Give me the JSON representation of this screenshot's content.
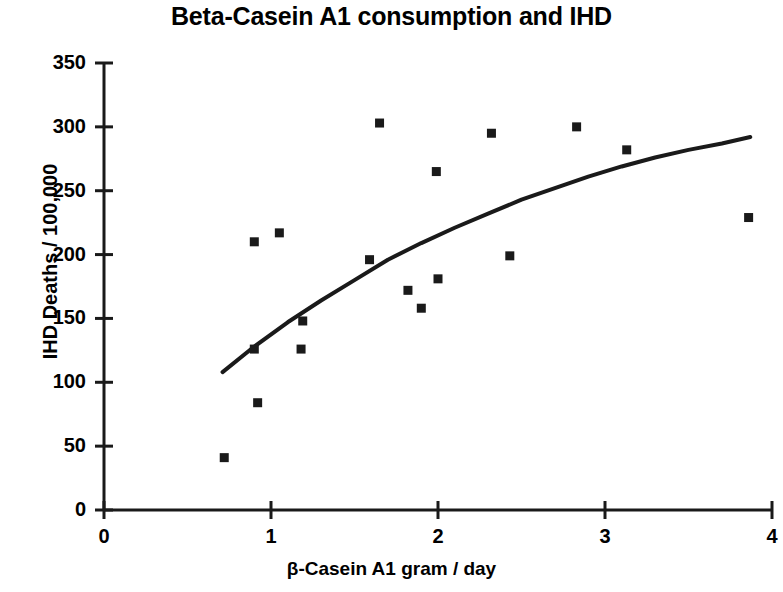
{
  "chart_data": {
    "type": "scatter",
    "title": "Beta-Casein A1 consumption and IHD",
    "xlabel": "β-Casein A1 gram / day",
    "ylabel": "IHD Deaths / 100,000",
    "xlim": [
      0,
      4
    ],
    "ylim": [
      0,
      350
    ],
    "xticks": [
      "0",
      "1",
      "2",
      "3",
      "4"
    ],
    "xtick_values": [
      0,
      1,
      2,
      3,
      4
    ],
    "yticks": [
      "0",
      "50",
      "100",
      "150",
      "200",
      "250",
      "300",
      "350"
    ],
    "ytick_values": [
      0,
      50,
      100,
      150,
      200,
      250,
      300,
      350
    ],
    "grid": false,
    "legend": false,
    "marker": "square",
    "marker_color": "#1a1a1a",
    "line_color": "#1a1a1a",
    "series": [
      {
        "name": "Countries",
        "type": "scatter",
        "points": [
          {
            "x": 0.72,
            "y": 41
          },
          {
            "x": 0.9,
            "y": 210
          },
          {
            "x": 0.9,
            "y": 126
          },
          {
            "x": 0.92,
            "y": 84
          },
          {
            "x": 1.05,
            "y": 217
          },
          {
            "x": 1.18,
            "y": 126
          },
          {
            "x": 1.19,
            "y": 148
          },
          {
            "x": 1.59,
            "y": 196
          },
          {
            "x": 1.65,
            "y": 303
          },
          {
            "x": 1.82,
            "y": 172
          },
          {
            "x": 1.9,
            "y": 158
          },
          {
            "x": 1.99,
            "y": 265
          },
          {
            "x": 2.0,
            "y": 181
          },
          {
            "x": 2.32,
            "y": 295
          },
          {
            "x": 2.43,
            "y": 199
          },
          {
            "x": 2.83,
            "y": 300
          },
          {
            "x": 3.13,
            "y": 282
          },
          {
            "x": 3.86,
            "y": 229
          }
        ]
      },
      {
        "name": "Fitted trend",
        "type": "line",
        "points": [
          {
            "x": 0.71,
            "y": 108
          },
          {
            "x": 0.9,
            "y": 128
          },
          {
            "x": 1.1,
            "y": 147
          },
          {
            "x": 1.3,
            "y": 164
          },
          {
            "x": 1.5,
            "y": 180
          },
          {
            "x": 1.7,
            "y": 196
          },
          {
            "x": 1.9,
            "y": 209
          },
          {
            "x": 2.1,
            "y": 221
          },
          {
            "x": 2.3,
            "y": 232
          },
          {
            "x": 2.5,
            "y": 243
          },
          {
            "x": 2.7,
            "y": 252
          },
          {
            "x": 2.9,
            "y": 261
          },
          {
            "x": 3.1,
            "y": 269
          },
          {
            "x": 3.3,
            "y": 276
          },
          {
            "x": 3.5,
            "y": 282
          },
          {
            "x": 3.7,
            "y": 287
          },
          {
            "x": 3.87,
            "y": 292
          }
        ]
      }
    ]
  }
}
